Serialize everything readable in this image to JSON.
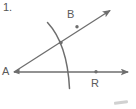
{
  "figure": {
    "number_label": "1.",
    "type": "geometry-angle-construction",
    "background_color": "#ffffff",
    "stroke_color": "#6e6e6e",
    "text_color": "#5a5a5a",
    "points": [
      {
        "name": "A",
        "label": "A",
        "role": "vertex",
        "x": 14,
        "y": 72
      },
      {
        "name": "B",
        "label": "B",
        "role": "ray-point",
        "x": 72,
        "y": 15
      },
      {
        "name": "R",
        "label": "R",
        "role": "ray-point",
        "x": 96,
        "y": 82
      }
    ],
    "markers": [
      {
        "name": "point-on-ray-ab",
        "x": 77,
        "y": 27
      },
      {
        "name": "point-arc-ray-intersection",
        "x": 61,
        "y": 43
      },
      {
        "name": "point-r-dot",
        "x": 96,
        "y": 72
      }
    ],
    "rays": [
      {
        "name": "ray-ab",
        "from": "A",
        "through": "B",
        "arrow": true,
        "x1": 14,
        "y1": 72,
        "x2": 113,
        "y2": 8
      },
      {
        "name": "ray-ar",
        "from": "A",
        "through": "R",
        "arrow": true,
        "x1": 14,
        "y1": 72,
        "x2": 131,
        "y2": 72
      }
    ],
    "arc": {
      "name": "compass-arc",
      "center": "A",
      "start_x": 47,
      "start_y": 22,
      "end_x": 70,
      "end_y": 89,
      "radius": 62
    },
    "smudge": {
      "name": "corner-artifact",
      "visible": true
    }
  }
}
